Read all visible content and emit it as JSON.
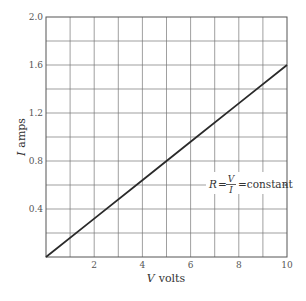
{
  "chart_data": {
    "type": "line",
    "title": "",
    "xlabel": "V volts",
    "xlabel_var": "V",
    "xlabel_unit": "volts",
    "ylabel": "I amps",
    "ylabel_var": "I",
    "ylabel_unit": "amps",
    "xlim": [
      0,
      10
    ],
    "ylim": [
      0,
      2.0
    ],
    "x_ticks": [
      "2",
      "4",
      "6",
      "8",
      "10"
    ],
    "y_ticks": [
      "0.4",
      "0.8",
      "1.2",
      "1.6",
      "2.0"
    ],
    "grid": true,
    "grid_x_step": 1,
    "grid_y_step": 0.2,
    "series": [
      {
        "name": "I vs V",
        "x": [
          0,
          2,
          4,
          6,
          8,
          10
        ],
        "y": [
          0,
          0.32,
          0.64,
          0.96,
          1.28,
          1.6
        ]
      }
    ],
    "annotations": [
      {
        "text": "R = V/I = constant",
        "lhs": "R",
        "num": "V",
        "den": "I",
        "rhs": "=constant",
        "x": 10,
        "y": 0.4
      }
    ]
  },
  "colors": {
    "grid": "#777777",
    "line": "#2a2a2a",
    "text": "#444444"
  }
}
